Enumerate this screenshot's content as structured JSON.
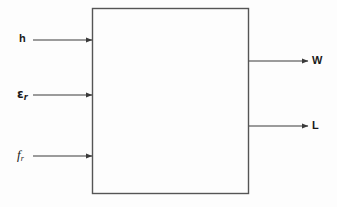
{
  "diagram": {
    "type": "block-diagram",
    "title": "",
    "background_color": "#fdfdfd",
    "line_color": "#3a3a3a",
    "text_color": "#1a1a1a",
    "block": {
      "label": "",
      "x": 92,
      "y": 8,
      "width": 157,
      "height": 186
    },
    "inputs": [
      {
        "id": "h",
        "label": "h",
        "subscript": "",
        "style": "sans",
        "arrow_y": 40,
        "line_start_x": 33,
        "line_end_x": 92
      },
      {
        "id": "epsilon_r",
        "label": "ε",
        "subscript": "r",
        "style": "epsilon",
        "arrow_y": 95,
        "line_start_x": 33,
        "line_end_x": 92
      },
      {
        "id": "f_r",
        "label": "f",
        "subscript": "r",
        "style": "serif-italic",
        "arrow_y": 156,
        "line_start_x": 33,
        "line_end_x": 92
      }
    ],
    "outputs": [
      {
        "id": "W",
        "label": "W",
        "style": "sans",
        "arrow_y": 61,
        "line_start_x": 249,
        "line_end_x": 307
      },
      {
        "id": "L",
        "label": "L",
        "style": "sans",
        "arrow_y": 126,
        "line_start_x": 249,
        "line_end_x": 307
      }
    ]
  }
}
